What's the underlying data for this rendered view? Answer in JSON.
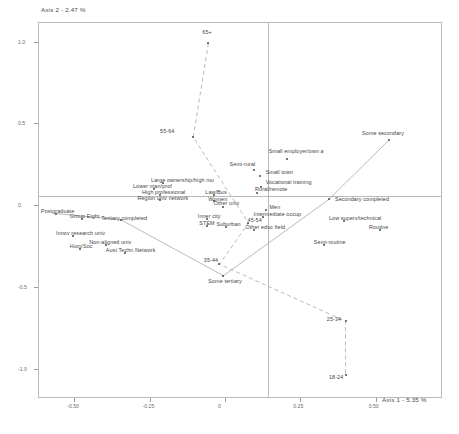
{
  "chart_data": {
    "type": "scatter",
    "title": "",
    "xlabel": "Axis 1  -  5.35 %",
    "ylabel": "Axis 2  -  2.47 %",
    "xlim": [
      -0.62,
      0.72
    ],
    "ylim": [
      -1.18,
      1.12
    ],
    "xticks": [
      "-0.50",
      "-0.25",
      "0",
      "0.25",
      "0.50"
    ],
    "xtick_values": [
      -0.5,
      -0.25,
      0,
      0.25,
      0.5
    ],
    "yticks": [
      "1.0",
      "0.5",
      "0",
      "-0.5",
      "-1.0"
    ],
    "ytick_values": [
      1.0,
      0.5,
      0,
      -0.5,
      -1.0
    ],
    "grid": false,
    "legend": "none",
    "points": [
      {
        "label": "65+",
        "x": -0.055,
        "y": 0.99,
        "lx": -0.075,
        "ly": 1.05
      },
      {
        "label": "55-64",
        "x": -0.105,
        "y": 0.415,
        "lx": -0.215,
        "ly": 0.445
      },
      {
        "label": "Some secondary",
        "x": 0.545,
        "y": 0.4,
        "lx": 0.455,
        "ly": 0.435
      },
      {
        "label": "Small employer/own a",
        "x": 0.205,
        "y": 0.285,
        "lx": 0.145,
        "ly": 0.325
      },
      {
        "label": "Semi-rural",
        "x": 0.095,
        "y": 0.215,
        "lx": 0.015,
        "ly": 0.245
      },
      {
        "label": "Small town",
        "x": 0.115,
        "y": 0.175,
        "lx": 0.135,
        "ly": 0.195
      },
      {
        "label": "Vocational training",
        "x": 0.118,
        "y": 0.113,
        "lx": 0.135,
        "ly": 0.135
      },
      {
        "label": "Rural/remote",
        "x": 0.105,
        "y": 0.075,
        "lx": 0.1,
        "ly": 0.09
      },
      {
        "label": "Secondary completed",
        "x": 0.345,
        "y": 0.035,
        "lx": 0.365,
        "ly": 0.03
      },
      {
        "label": "Large ownership/high mu",
        "x": -0.205,
        "y": 0.135,
        "lx": -0.245,
        "ly": 0.15
      },
      {
        "label": "Lower man/prof",
        "x": -0.235,
        "y": 0.098,
        "lx": -0.305,
        "ly": 0.11
      },
      {
        "label": "High professional",
        "x": -0.215,
        "y": 0.06,
        "lx": -0.275,
        "ly": 0.072
      },
      {
        "label": "Region univ network",
        "x": -0.215,
        "y": 0.032,
        "lx": -0.29,
        "ly": 0.04
      },
      {
        "label": "Law/Bus",
        "x": -0.035,
        "y": 0.06,
        "lx": -0.065,
        "ly": 0.072
      },
      {
        "label": "Women",
        "x": -0.035,
        "y": 0.022,
        "lx": -0.055,
        "ly": 0.03
      },
      {
        "label": "Other univ",
        "x": -0.008,
        "y": -0.01,
        "lx": -0.038,
        "ly": 0.005
      },
      {
        "label": "Men",
        "x": 0.135,
        "y": -0.03,
        "lx": 0.148,
        "ly": -0.02
      },
      {
        "label": "Postgraduate",
        "x": -0.56,
        "y": -0.052,
        "lx": -0.61,
        "ly": -0.04
      },
      {
        "label": "Group Eight",
        "x": -0.475,
        "y": -0.085,
        "lx": -0.515,
        "ly": -0.075
      },
      {
        "label": "Tertiary completed",
        "x": -0.345,
        "y": -0.09,
        "lx": -0.41,
        "ly": -0.082
      },
      {
        "label": "Inner city",
        "x": -0.06,
        "y": -0.085,
        "lx": -0.09,
        "ly": -0.072
      },
      {
        "label": "Intermediate occup",
        "x": 0.125,
        "y": -0.075,
        "lx": 0.095,
        "ly": -0.062
      },
      {
        "label": "45-54",
        "x": 0.078,
        "y": -0.11,
        "lx": 0.075,
        "ly": -0.098
      },
      {
        "label": "Low superv/technical",
        "x": 0.395,
        "y": -0.098,
        "lx": 0.345,
        "ly": -0.085
      },
      {
        "label": "STEM",
        "x": -0.06,
        "y": -0.13,
        "lx": -0.085,
        "ly": -0.118
      },
      {
        "label": "Suburban",
        "x": 0.002,
        "y": -0.135,
        "lx": -0.028,
        "ly": -0.122
      },
      {
        "label": "Other educ field",
        "x": 0.098,
        "y": -0.15,
        "lx": 0.068,
        "ly": -0.14
      },
      {
        "label": "Routine",
        "x": 0.515,
        "y": -0.152,
        "lx": 0.478,
        "ly": -0.14
      },
      {
        "label": "Innov research univ",
        "x": -0.505,
        "y": -0.19,
        "lx": -0.56,
        "ly": -0.178
      },
      {
        "label": "Non-aligned univ",
        "x": -0.395,
        "y": -0.245,
        "lx": -0.45,
        "ly": -0.232
      },
      {
        "label": "Hum/Soc",
        "x": -0.48,
        "y": -0.268,
        "lx": -0.515,
        "ly": -0.258
      },
      {
        "label": "Aust Techn Network",
        "x": -0.33,
        "y": -0.29,
        "lx": -0.395,
        "ly": -0.28
      },
      {
        "label": "Semi-routine",
        "x": 0.33,
        "y": -0.245,
        "lx": 0.295,
        "ly": -0.232
      },
      {
        "label": "35-44",
        "x": -0.018,
        "y": -0.362,
        "lx": -0.07,
        "ly": -0.345
      },
      {
        "label": "Some tertiary",
        "x": -0.005,
        "y": -0.432,
        "lx": -0.055,
        "ly": -0.47
      },
      {
        "label": "25-34",
        "x": 0.4,
        "y": -0.71,
        "lx": 0.338,
        "ly": -0.7
      },
      {
        "label": "18-24",
        "x": 0.4,
        "y": -1.04,
        "lx": 0.345,
        "ly": -1.055
      }
    ],
    "trajectories": [
      {
        "name": "age-trajectory",
        "style": "dashed",
        "path": [
          "65+",
          "55-64",
          "45-54",
          "35-44",
          "25-34",
          "18-24"
        ]
      },
      {
        "name": "education-trajectory",
        "style": "solid",
        "path": [
          "Postgraduate",
          "Tertiary completed",
          "Some tertiary",
          "Secondary completed",
          "Some secondary"
        ]
      }
    ]
  }
}
